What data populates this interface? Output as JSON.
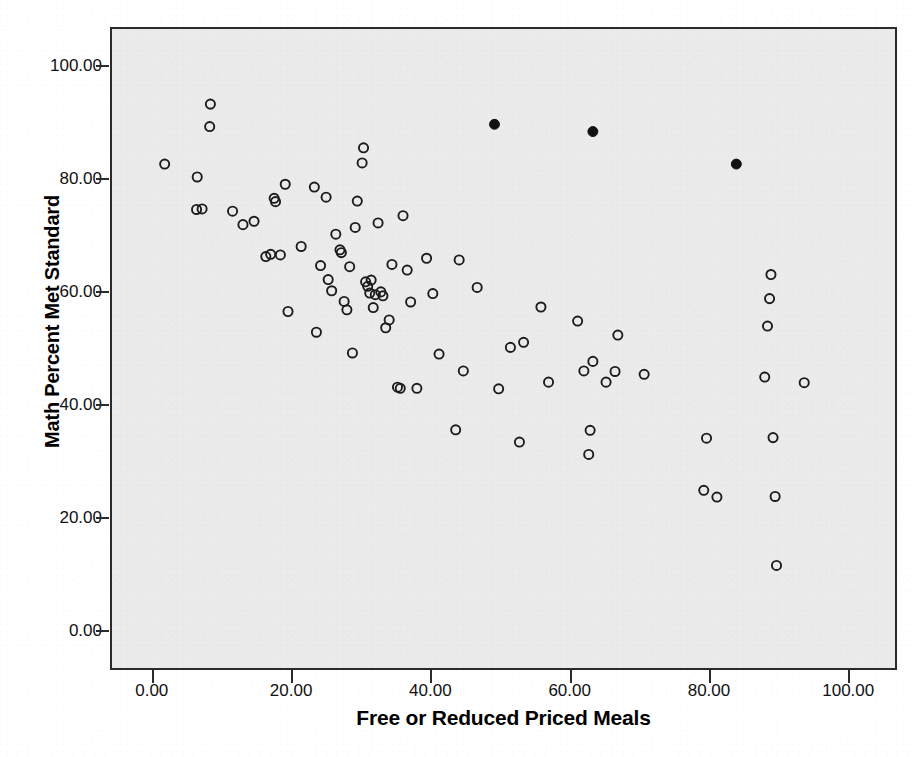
{
  "chart_data": {
    "type": "scatter",
    "title": "",
    "subtitle": "",
    "xlabel": "Free or Reduced Priced Meals",
    "ylabel": "Math Percent Met Standard",
    "xlim": [
      -6,
      107
    ],
    "ylim": [
      -7,
      107
    ],
    "xticks": [
      0,
      20,
      40,
      60,
      80,
      100
    ],
    "yticks": [
      0,
      20,
      40,
      60,
      80,
      100
    ],
    "xtick_labels": [
      "0.00",
      "20.00",
      "40.00",
      "60.00",
      "80.00",
      "100.00"
    ],
    "ytick_labels": [
      "0.00",
      "20.00",
      "40.00",
      "60.00",
      "80.00",
      "100.00"
    ],
    "grid": false,
    "legend": null,
    "plot_background_color": "#ebebeb",
    "frame_color": "#2b2b2b",
    "marker_size_px": 11,
    "series": [
      {
        "name": "Schools (unmarked)",
        "marker": "open-circle",
        "color": "#1c1c1c",
        "fill": "none",
        "points": [
          [
            1.6,
            82.9
          ],
          [
            6.3,
            80.6
          ],
          [
            6.2,
            74.8
          ],
          [
            7.0,
            74.9
          ],
          [
            8.2,
            93.6
          ],
          [
            8.1,
            89.6
          ],
          [
            11.4,
            74.5
          ],
          [
            12.9,
            72.1
          ],
          [
            14.5,
            72.7
          ],
          [
            16.2,
            66.4
          ],
          [
            16.9,
            66.8
          ],
          [
            17.4,
            76.8
          ],
          [
            17.6,
            76.2
          ],
          [
            18.3,
            66.7
          ],
          [
            19.0,
            79.3
          ],
          [
            19.4,
            56.6
          ],
          [
            21.3,
            68.2
          ],
          [
            23.2,
            78.8
          ],
          [
            23.5,
            52.9
          ],
          [
            24.1,
            64.8
          ],
          [
            24.9,
            77.0
          ],
          [
            25.2,
            62.3
          ],
          [
            25.7,
            60.3
          ],
          [
            26.3,
            70.4
          ],
          [
            26.9,
            67.6
          ],
          [
            27.1,
            67.1
          ],
          [
            27.5,
            58.4
          ],
          [
            27.9,
            56.9
          ],
          [
            28.3,
            64.6
          ],
          [
            28.7,
            49.2
          ],
          [
            29.1,
            71.6
          ],
          [
            29.4,
            76.3
          ],
          [
            30.1,
            83.1
          ],
          [
            30.3,
            85.8
          ],
          [
            30.6,
            61.9
          ],
          [
            30.9,
            61.1
          ],
          [
            31.2,
            59.9
          ],
          [
            31.4,
            62.2
          ],
          [
            31.7,
            57.3
          ],
          [
            32.0,
            59.6
          ],
          [
            32.4,
            72.4
          ],
          [
            32.8,
            60.1
          ],
          [
            33.1,
            59.4
          ],
          [
            33.5,
            53.7
          ],
          [
            34.0,
            55.1
          ],
          [
            34.4,
            65.0
          ],
          [
            35.2,
            43.1
          ],
          [
            35.6,
            42.9
          ],
          [
            36.0,
            73.7
          ],
          [
            36.6,
            64.0
          ],
          [
            37.1,
            58.3
          ],
          [
            38.0,
            42.9
          ],
          [
            39.4,
            66.1
          ],
          [
            40.3,
            59.8
          ],
          [
            41.2,
            49.0
          ],
          [
            43.6,
            35.5
          ],
          [
            44.1,
            65.8
          ],
          [
            44.7,
            46.0
          ],
          [
            46.7,
            60.9
          ],
          [
            49.8,
            42.8
          ],
          [
            51.5,
            50.2
          ],
          [
            52.8,
            33.3
          ],
          [
            53.4,
            51.1
          ],
          [
            55.9,
            57.4
          ],
          [
            57.0,
            44.0
          ],
          [
            61.2,
            54.9
          ],
          [
            62.1,
            46.0
          ],
          [
            62.8,
            31.1
          ],
          [
            63.0,
            35.4
          ],
          [
            63.4,
            47.7
          ],
          [
            65.3,
            44.0
          ],
          [
            66.6,
            45.9
          ],
          [
            67.0,
            52.4
          ],
          [
            70.8,
            45.4
          ],
          [
            79.4,
            24.7
          ],
          [
            79.8,
            34.0
          ],
          [
            81.3,
            23.5
          ],
          [
            88.2,
            44.9
          ],
          [
            88.6,
            54.0
          ],
          [
            88.9,
            58.9
          ],
          [
            89.1,
            63.2
          ],
          [
            89.4,
            34.1
          ],
          [
            89.7,
            23.6
          ],
          [
            89.9,
            11.3
          ],
          [
            93.9,
            43.9
          ]
        ]
      },
      {
        "name": "Highlighted schools",
        "marker": "filled-circle",
        "color": "#111111",
        "fill": "#111111",
        "points": [
          [
            49.2,
            90.0
          ],
          [
            63.4,
            88.7
          ],
          [
            84.1,
            82.9
          ]
        ]
      }
    ]
  },
  "axes": {
    "y_title": "Math Percent Met Standard",
    "x_title": "Free or Reduced Priced Meals"
  }
}
